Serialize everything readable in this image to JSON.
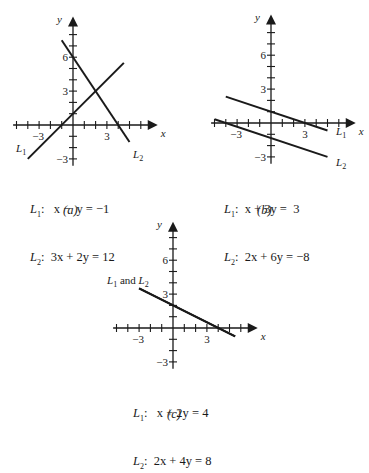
{
  "figure": {
    "panels": [
      {
        "id": "a",
        "caption": "(a)",
        "x_label": "x",
        "y_label": "y",
        "x_ticks_labeled": [
          "-3",
          "3"
        ],
        "y_ticks_labeled": [
          "6",
          "3",
          "-3"
        ],
        "line_labels": [
          "L1",
          "L2"
        ],
        "equations": [
          {
            "name": "L1",
            "text": "x −  y = −1"
          },
          {
            "name": "L2",
            "text": "3x + 2y = 12"
          }
        ]
      },
      {
        "id": "b",
        "caption": "(b)",
        "x_label": "x",
        "y_label": "y",
        "x_ticks_labeled": [
          "-3",
          "3"
        ],
        "y_ticks_labeled": [
          "6",
          "3",
          "-3"
        ],
        "line_labels": [
          "L1",
          "L2"
        ],
        "equations": [
          {
            "name": "L1",
            "text": "x + 3y =  3"
          },
          {
            "name": "L2",
            "text": "2x + 6y = −8"
          }
        ]
      },
      {
        "id": "c",
        "caption": "(c)",
        "x_label": "x",
        "y_label": "y",
        "x_ticks_labeled": [
          "-3",
          "3"
        ],
        "y_ticks_labeled": [
          "6",
          "3",
          "-3"
        ],
        "line_labels": [
          "L1 and L2"
        ],
        "equations": [
          {
            "name": "L1",
            "text": "x + 2y = 4"
          },
          {
            "name": "L2",
            "text": "2x + 4y = 8"
          }
        ]
      }
    ]
  },
  "chart_data": [
    {
      "type": "line",
      "panel": "a",
      "title": "(a) Intersecting lines",
      "xlabel": "x",
      "ylabel": "y",
      "xlim": [
        -5,
        7
      ],
      "ylim": [
        -4,
        9
      ],
      "grid": false,
      "series": [
        {
          "name": "L1: x - y = -1",
          "x": [
            -4,
            4.5
          ],
          "y": [
            -3,
            5.5
          ]
        },
        {
          "name": "L2: 3x + 2y = 12",
          "x": [
            -1,
            5
          ],
          "y": [
            7.5,
            -1.5
          ]
        }
      ],
      "annotations": [
        "L1",
        "L2"
      ]
    },
    {
      "type": "line",
      "panel": "b",
      "title": "(b) Parallel lines",
      "xlabel": "x",
      "ylabel": "y",
      "xlim": [
        -5,
        7
      ],
      "ylim": [
        -4,
        9
      ],
      "grid": false,
      "series": [
        {
          "name": "L1: x + 3y = 3",
          "x": [
            -4,
            5
          ],
          "y": [
            2.333,
            -0.667
          ]
        },
        {
          "name": "L2: 2x + 6y = -8",
          "x": [
            -5,
            5
          ],
          "y": [
            0.333,
            -3
          ]
        }
      ],
      "annotations": [
        "L1",
        "L2"
      ]
    },
    {
      "type": "line",
      "panel": "c",
      "title": "(c) Coincident lines",
      "xlabel": "x",
      "ylabel": "y",
      "xlim": [
        -5,
        7
      ],
      "ylim": [
        -4,
        9
      ],
      "grid": false,
      "series": [
        {
          "name": "L1: x + 2y = 4",
          "x": [
            -3,
            5.5
          ],
          "y": [
            3.5,
            -0.75
          ]
        },
        {
          "name": "L2: 2x + 4y = 8",
          "x": [
            -3,
            5.5
          ],
          "y": [
            3.5,
            -0.75
          ]
        }
      ],
      "annotations": [
        "L1 and L2"
      ]
    }
  ]
}
